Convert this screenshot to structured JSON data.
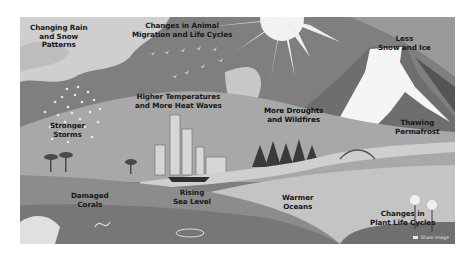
{
  "figure": {
    "type": "grayscale-illustration",
    "colors": {
      "sky_dark": "#7f7f7f",
      "cloud": "#cfcfcf",
      "sun": "#f2f2f2",
      "mountain": "#6e6e6e",
      "snow": "#f5f5f5",
      "land": "#b0b0b0",
      "sea": "#8c8c8c",
      "deep_sea": "#777777",
      "text": "#1a1a1a"
    }
  },
  "labels": {
    "rain_snow": [
      "Changing Rain",
      "and Snow",
      "Patterns"
    ],
    "animal_migration": [
      "Changes in Animal",
      "Migration and Life Cycles"
    ],
    "less_snow": [
      "Less",
      "Snow and Ice"
    ],
    "heat_waves": [
      "Higher Temperatures",
      "and More Heat Waves"
    ],
    "droughts": [
      "More Droughts",
      "and Wildfires"
    ],
    "storms": [
      "Stronger",
      "Storms"
    ],
    "permafrost": [
      "Thawing",
      "Permafrost"
    ],
    "corals": [
      "Damaged",
      "Corals"
    ],
    "sea_level": [
      "Rising",
      "Sea Level"
    ],
    "oceans": [
      "Warmer",
      "Oceans"
    ],
    "plants": [
      "Changes in",
      "Plant Life Cycles"
    ]
  },
  "watermark": {
    "icon": "share-icon",
    "text": "Share Image"
  }
}
